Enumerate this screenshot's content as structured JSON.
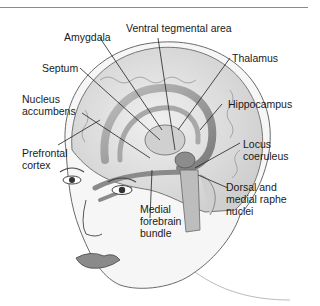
{
  "figure": {
    "labels": {
      "amygdala": "Amygdala",
      "ventral_tegmental_area": "Ventral tegmental area",
      "thalamus": "Thalamus",
      "septum": "Septum",
      "nucleus_accumbens_1": "Nucleus",
      "nucleus_accumbens_2": "accumbens",
      "hippocampus": "Hippocampus",
      "prefrontal_cortex_1": "Prefrontal",
      "prefrontal_cortex_2": "cortex",
      "locus_coeruleus_1": "Locus",
      "locus_coeruleus_2": "coeruleus",
      "medial_forebrain_bundle_1": "Medial",
      "medial_forebrain_bundle_2": "forebrain",
      "medial_forebrain_bundle_3": "bundle",
      "raphe_nuclei_1": "Dorsal and",
      "raphe_nuclei_2": "medial raphe",
      "raphe_nuclei_3": "nuclei"
    },
    "colors": {
      "ink": "#1a1a1a",
      "brain_fill": "#e4e4e4",
      "structure_fill": "#9a9a9a",
      "skin_fill": "#f4f4f4",
      "rule": "#8a8a8a"
    }
  }
}
